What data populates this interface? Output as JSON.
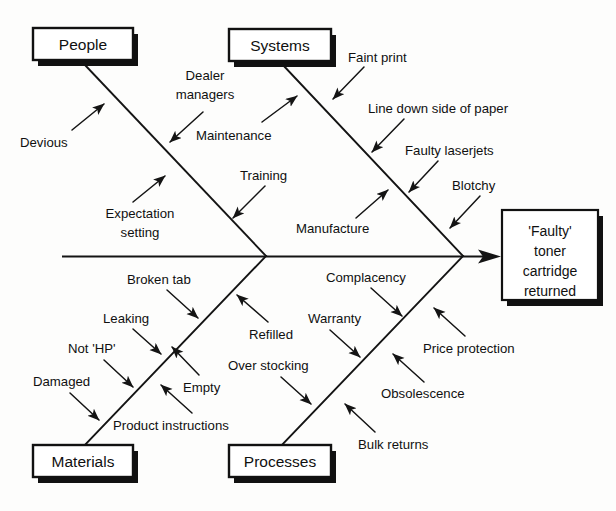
{
  "diagram": {
    "type": "fishbone-ishikawa",
    "title_text_visible": false,
    "effect": {
      "lines": [
        "'Faulty'",
        "toner",
        "cartridge",
        "returned"
      ],
      "full_text": "'Faulty' toner cartridge returned"
    },
    "categories": [
      {
        "id": "people",
        "label": "People",
        "position": "top-left",
        "causes": [
          {
            "id": "devious",
            "label": "Devious",
            "side": "left"
          },
          {
            "id": "dealer-managers",
            "label": "Dealer managers",
            "lines": [
              "Dealer",
              "managers"
            ],
            "side": "right"
          },
          {
            "id": "expectation-setting",
            "label": "Expectation setting",
            "lines": [
              "Expectation",
              "setting"
            ],
            "side": "left"
          },
          {
            "id": "training",
            "label": "Training",
            "side": "right"
          }
        ]
      },
      {
        "id": "systems",
        "label": "Systems",
        "position": "top-right",
        "causes": [
          {
            "id": "maintenance",
            "label": "Maintenance",
            "side": "left"
          },
          {
            "id": "faint-print",
            "label": "Faint print",
            "side": "right"
          },
          {
            "id": "line-down-side",
            "label": "Line down side of paper",
            "side": "right"
          },
          {
            "id": "faulty-laserjets",
            "label": "Faulty laserjets",
            "side": "left"
          },
          {
            "id": "manufacture",
            "label": "Manufacture",
            "side": "right"
          },
          {
            "id": "blotchy",
            "label": "Blotchy",
            "side": "right"
          }
        ]
      },
      {
        "id": "materials",
        "label": "Materials",
        "position": "bottom-left",
        "causes": [
          {
            "id": "broken-tab",
            "label": "Broken tab",
            "side": "left"
          },
          {
            "id": "leaking",
            "label": "Leaking",
            "side": "left"
          },
          {
            "id": "not-hp",
            "label": "Not 'HP'",
            "side": "left"
          },
          {
            "id": "damaged",
            "label": "Damaged",
            "side": "left"
          },
          {
            "id": "empty",
            "label": "Empty",
            "side": "right"
          },
          {
            "id": "product-instructions",
            "label": "Product instructions",
            "side": "right"
          },
          {
            "id": "refilled",
            "label": "Refilled",
            "side": "right"
          }
        ]
      },
      {
        "id": "processes",
        "label": "Processes",
        "position": "bottom-right",
        "causes": [
          {
            "id": "complacency",
            "label": "Complacency",
            "side": "left"
          },
          {
            "id": "warranty",
            "label": "Warranty",
            "side": "left"
          },
          {
            "id": "over-stocking",
            "label": "Over stocking",
            "side": "left"
          },
          {
            "id": "price-protection",
            "label": "Price protection",
            "side": "right"
          },
          {
            "id": "obsolescence",
            "label": "Obsolescence",
            "side": "right"
          },
          {
            "id": "bulk-returns",
            "label": "Bulk returns",
            "side": "right"
          }
        ]
      }
    ]
  }
}
